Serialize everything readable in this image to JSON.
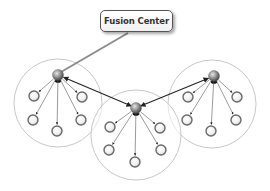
{
  "diagram": {
    "fusion_center": {
      "label": "Fusion Center",
      "box": {
        "x": 100,
        "y": 10,
        "w": 73,
        "h": 22
      },
      "link_to": "cluster-left-hub"
    },
    "colors": {
      "cluster_boundary": "#c8c8c8",
      "hub_fill": "#8a8a8a",
      "leaf_ring": "#6a6a6a",
      "leaf_fill": "#f4f4f4",
      "edge": "#222222",
      "fusion_link": "#8c8c8c"
    },
    "clusters": [
      {
        "id": "left",
        "boundary": {
          "cx": 58,
          "cy": 103,
          "r": 44
        },
        "hub": {
          "x": 58,
          "y": 75
        },
        "leaves": [
          {
            "x": 34,
            "y": 96
          },
          {
            "x": 82,
            "y": 97
          },
          {
            "x": 33,
            "y": 120
          },
          {
            "x": 81,
            "y": 120
          },
          {
            "x": 57,
            "y": 131
          }
        ]
      },
      {
        "id": "center",
        "boundary": {
          "cx": 136,
          "cy": 135,
          "r": 45
        },
        "hub": {
          "x": 136,
          "y": 108
        },
        "leaves": [
          {
            "x": 110,
            "y": 127
          },
          {
            "x": 160,
            "y": 128
          },
          {
            "x": 109,
            "y": 150
          },
          {
            "x": 161,
            "y": 150
          },
          {
            "x": 135,
            "y": 162
          }
        ]
      },
      {
        "id": "right",
        "boundary": {
          "cx": 212,
          "cy": 104,
          "r": 44
        },
        "hub": {
          "x": 214,
          "y": 76
        },
        "leaves": [
          {
            "x": 188,
            "y": 97
          },
          {
            "x": 237,
            "y": 97
          },
          {
            "x": 187,
            "y": 120
          },
          {
            "x": 236,
            "y": 120
          },
          {
            "x": 211,
            "y": 131
          }
        ]
      }
    ],
    "inter_hub_links": [
      {
        "from": "center",
        "to": "left"
      },
      {
        "from": "center",
        "to": "right"
      }
    ]
  }
}
